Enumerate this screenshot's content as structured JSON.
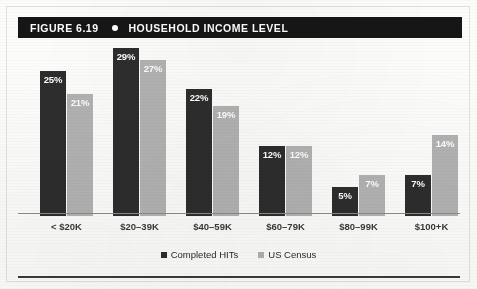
{
  "figure": {
    "label": "FIGURE 6.19",
    "dot_icon": "bullet-dot-icon",
    "title": "HOUSEHOLD INCOME LEVEL"
  },
  "colors": {
    "series_dark": "#2d2d2d",
    "series_light": "#b2b2b2",
    "title_bar_bg": "#161616",
    "title_text": "#ffffff",
    "axis_line": "#8d8d8d",
    "page_bg": "#fcfcfb"
  },
  "legend": {
    "items": [
      {
        "label": "Completed HITs",
        "swatch": "dark"
      },
      {
        "label": "US Census",
        "swatch": "light"
      }
    ]
  },
  "chart_data": {
    "type": "bar",
    "title": "HOUSEHOLD INCOME LEVEL",
    "subtitle": "FIGURE 6.19",
    "xlabel": "",
    "ylabel": "",
    "ylim": [
      0,
      29
    ],
    "grid": false,
    "legend_position": "bottom-center",
    "value_suffix": "%",
    "categories": [
      "< $20K",
      "$20–39K",
      "$40–59K",
      "$60–79K",
      "$80–99K",
      "$100+K"
    ],
    "series": [
      {
        "name": "Completed HITs",
        "color": "#2d2d2d",
        "values": [
          25,
          29,
          22,
          12,
          5,
          7
        ],
        "labels": [
          "25%",
          "29%",
          "22%",
          "12%",
          "5%",
          "7%"
        ]
      },
      {
        "name": "US Census",
        "color": "#b2b2b2",
        "values": [
          21,
          27,
          19,
          12,
          7,
          14
        ],
        "labels": [
          "21%",
          "27%",
          "19%",
          "12%",
          "7%",
          "14%"
        ]
      }
    ]
  }
}
